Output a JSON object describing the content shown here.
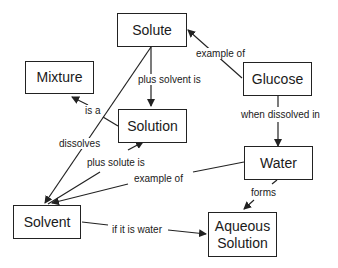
{
  "diagram": {
    "title": "",
    "nodes": {
      "solute": "Solute",
      "mixture": "Mixture",
      "glucose": "Glucose",
      "solution": "Solution",
      "water": "Water",
      "solvent": "Solvent",
      "aqueous_solution": "Aqueous Solution"
    },
    "links": {
      "example_of_glucose": "example of",
      "plus_solvent_is": "plus solvent is",
      "is_a": "is a",
      "when_dissolved_in": "when dissolved in",
      "dissolves": "dissolves",
      "plus_solute_is": "plus solute is",
      "example_of_water": "example of",
      "forms": "forms",
      "if_it_is_water": "if it is water"
    },
    "colors": {
      "line": "#222222",
      "text": "#1a1a1a",
      "background": "#ffffff"
    }
  }
}
